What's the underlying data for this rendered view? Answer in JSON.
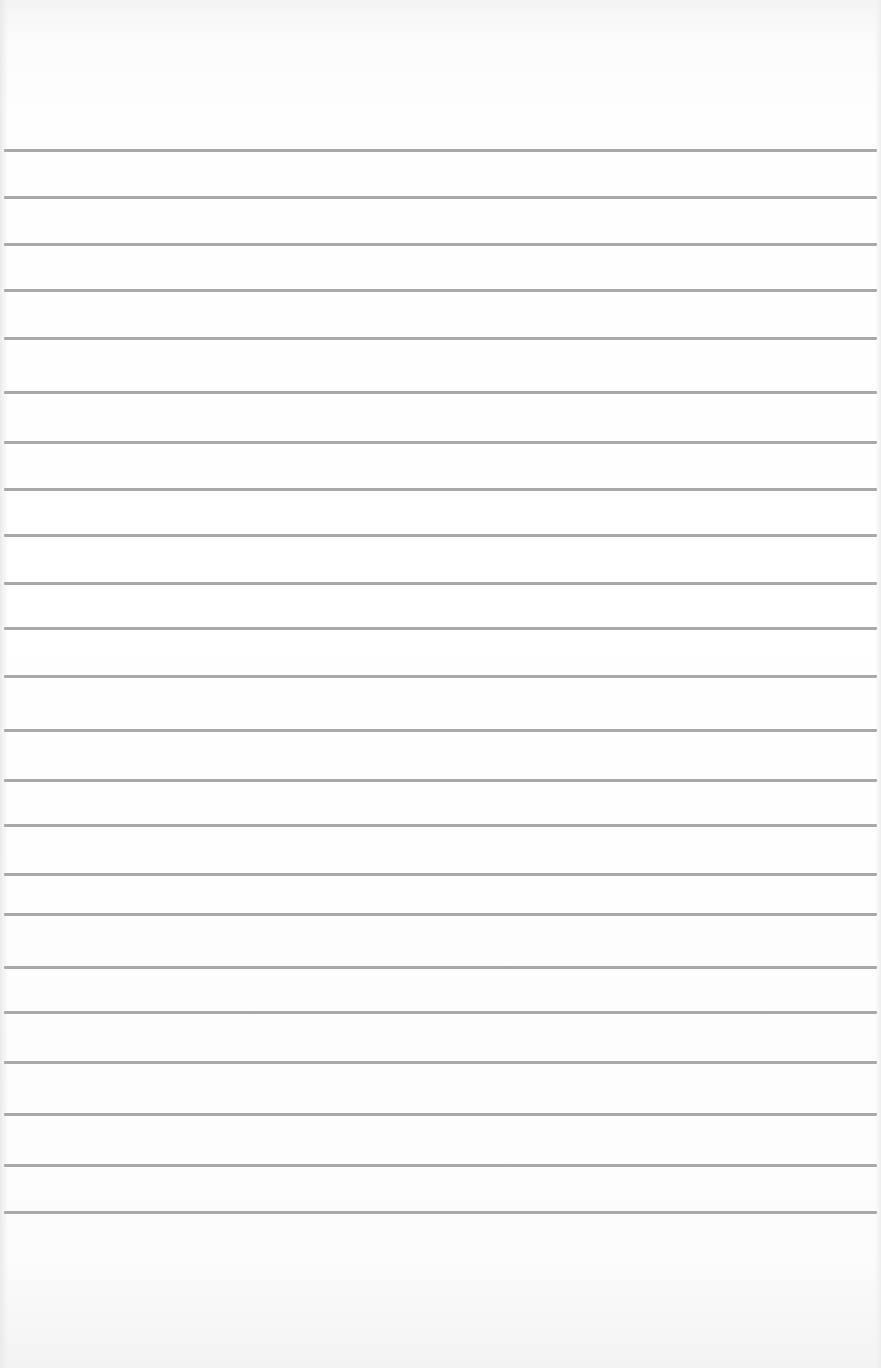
{
  "image": {
    "subject": "lined notebook paper",
    "background_color": "#ffffff",
    "rule_color": "#a9a9a9",
    "rule_count": 23,
    "rule_positions_y": [
      150,
      197,
      244,
      290,
      338,
      392,
      442,
      489,
      535,
      583,
      628,
      676,
      730,
      780,
      825,
      874,
      914,
      967,
      1012,
      1062,
      1114,
      1165,
      1212
    ]
  }
}
